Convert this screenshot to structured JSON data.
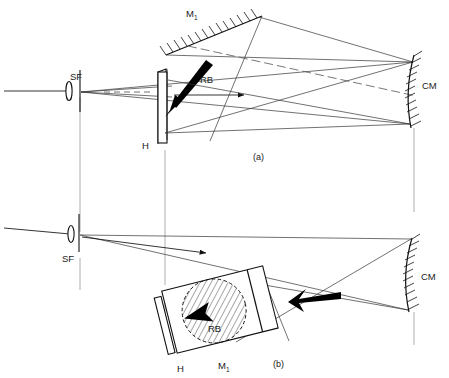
{
  "figure": {
    "type": "optical-setup-diagram",
    "background_color": "#ffffff",
    "ink_color": "#111111",
    "panels": [
      {
        "id": "a",
        "caption": "(a)",
        "caption_x": 258,
        "caption_y": 157,
        "labels": [
          {
            "name": "spatial-filter",
            "text": "SF",
            "x": 76,
            "y": 79
          },
          {
            "name": "hologram",
            "text": "H",
            "x": 146,
            "y": 146
          },
          {
            "name": "mirror-m1",
            "text": "M",
            "sub": "1",
            "x": 192,
            "y": 15
          },
          {
            "name": "reference-beam",
            "text": "RB",
            "x": 205,
            "y": 80
          },
          {
            "name": "concave-mirror",
            "text": "CM",
            "x": 425,
            "y": 86
          }
        ]
      },
      {
        "id": "b",
        "caption": "(b)",
        "caption_x": 278,
        "caption_y": 364,
        "labels": [
          {
            "name": "spatial-filter",
            "text": "SF",
            "x": 66,
            "y": 259
          },
          {
            "name": "hologram",
            "text": "H",
            "x": 181,
            "y": 369
          },
          {
            "name": "mirror-m1",
            "text": "M",
            "sub": "1",
            "x": 223,
            "y": 366
          },
          {
            "name": "reference-beam",
            "text": "RB",
            "x": 213,
            "y": 329
          },
          {
            "name": "concave-mirror",
            "text": "CM",
            "x": 424,
            "y": 277
          }
        ]
      }
    ],
    "components": {
      "SF": "spatial filter (lens + pinhole)",
      "H": "hologram plate",
      "M1": "plane mirror M1",
      "RB": "reference beam",
      "CM": "concave mirror"
    }
  }
}
